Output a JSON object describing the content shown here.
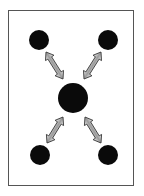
{
  "diagram": {
    "frame": {
      "x": 8.5,
      "y": 10.5,
      "width": 125,
      "height": 175,
      "stroke": "#555555"
    },
    "nodes": [
      {
        "id": "top-left",
        "cx": 39,
        "cy": 40,
        "r": 10
      },
      {
        "id": "top-right",
        "cx": 108,
        "cy": 40,
        "r": 10
      },
      {
        "id": "center",
        "cx": 73,
        "cy": 98,
        "r": 15
      },
      {
        "id": "bottom-left",
        "cx": 40,
        "cy": 155,
        "r": 10
      },
      {
        "id": "bottom-right",
        "cx": 108,
        "cy": 155,
        "r": 10
      }
    ],
    "arrows": [
      {
        "id": "top-left-to-center",
        "x1": 46,
        "y1": 52,
        "x2": 63,
        "y2": 79
      },
      {
        "id": "top-right-to-center",
        "x1": 101,
        "y1": 52,
        "x2": 84,
        "y2": 79
      },
      {
        "id": "bottom-left-to-center",
        "x1": 47,
        "y1": 143,
        "x2": 63,
        "y2": 117
      },
      {
        "id": "bottom-right-to-center",
        "x1": 101,
        "y1": 143,
        "x2": 85,
        "y2": 117
      }
    ],
    "colors": {
      "node": "#0a0a0a",
      "arrow_stroke": "#333333",
      "arrow_light": "#f4f4f4",
      "arrow_dark": "#6e6e6e",
      "background": "#ffffff"
    }
  }
}
